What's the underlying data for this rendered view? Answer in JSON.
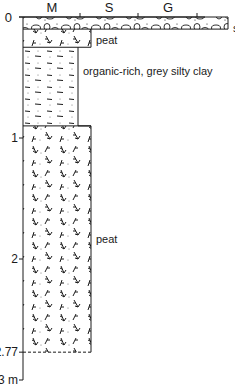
{
  "diagram": {
    "type": "stratigraphic-log",
    "grain_size_axis": {
      "zero_label": "0",
      "classes": [
        "M",
        "S",
        "G"
      ]
    },
    "depth_axis": {
      "unit": "m",
      "ticks": [
        {
          "value": 0,
          "label": "0"
        },
        {
          "value": 1,
          "label": "1"
        },
        {
          "value": 2,
          "label": "2"
        },
        {
          "value": 2.77,
          "label": "2.77"
        },
        {
          "value": 3,
          "label": "3 m"
        }
      ],
      "range": [
        0,
        3
      ]
    },
    "layers": [
      {
        "name": "silty sandy gravel",
        "label_lines": [
          "silty sandy",
          "gravel"
        ],
        "top": 0,
        "bottom": 0.1,
        "grain_class": "G",
        "pattern": "gravel"
      },
      {
        "name": "peat",
        "label_lines": [
          "peat"
        ],
        "top": 0.1,
        "bottom": 0.25,
        "grain_class": "M+",
        "pattern": "peat"
      },
      {
        "name": "organic-rich, grey silty clay",
        "label_lines": [
          "organic-rich, grey silty clay"
        ],
        "top": 0.25,
        "bottom": 0.9,
        "grain_class": "M",
        "pattern": "clay"
      },
      {
        "name": "peat",
        "label_lines": [
          "peat"
        ],
        "top": 0.9,
        "bottom": 2.77,
        "grain_class": "M+",
        "pattern": "peat"
      }
    ],
    "base_of_log": {
      "depth": 2.77,
      "style": "dashed"
    }
  }
}
